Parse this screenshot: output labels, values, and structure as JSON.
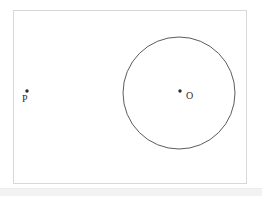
{
  "figure": {
    "background_color": "#ffffff",
    "frame": {
      "x": 13,
      "y": 10,
      "width": 234,
      "height": 174,
      "stroke_color": "#d8d8da",
      "stroke_width": 1,
      "fill": "#ffffff"
    },
    "circle": {
      "label": "circle-O",
      "center_x": 179,
      "center_y": 93,
      "radius": 56,
      "stroke_color": "#4a4a4a",
      "stroke_width": 0.9,
      "fill": "none"
    },
    "points": [
      {
        "id": "point-p",
        "label": "P",
        "x": 27,
        "y": 91,
        "dot_radius": 1.7,
        "color": "#2b2b2b",
        "label_offset_x": -5,
        "label_offset_y": 13
      },
      {
        "id": "point-o",
        "label": "O",
        "x": 180,
        "y": 91,
        "dot_radius": 1.7,
        "color": "#2b2b2b",
        "label_offset_x": 6,
        "label_offset_y": 10
      }
    ],
    "footer": {
      "band_color": "#f2f2f3",
      "band_top": 188,
      "band_height": 7
    }
  }
}
